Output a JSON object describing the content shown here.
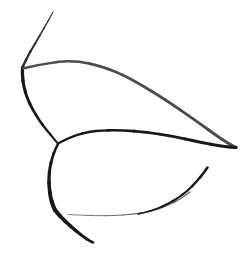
{
  "canvas": {
    "width": 252,
    "height": 255,
    "background_color": "#ffffff",
    "title": "Abstract ink line drawing",
    "medium": "pen-and-ink contour sketch",
    "has_text": false,
    "has_color": false
  },
  "palette": {
    "ink_dark": "#18181a",
    "ink_mid": "#2e2e32",
    "ink_light": "#4a4a50",
    "ink_faint": "#6b6b72",
    "paper": "#ffffff"
  },
  "strokes": [
    {
      "name": "top-antenna-stroke",
      "description": "thin curve descending from top edge to the upper-left cusp",
      "color_key": "ink_mid",
      "width_start": 1.0,
      "width_end": 2.6,
      "path": "M 53 12 C 45 27 36 42 29 54 C 26 60 24 64 22.5 67.5"
    },
    {
      "name": "upper-left-cusp-down-stroke",
      "description": "heavy stroke from the cusp running down-left then curving right into the lower body junction",
      "color_key": "ink_dark",
      "width_start": 3.4,
      "width_end": 2.0,
      "path": "M 22.5 67.5 C 22 76 23 86 27 97 C 32 110 41 124 50 134 C 54 139 56 141.5 58 143.5"
    },
    {
      "name": "upper-body-top-contour",
      "description": "long thin arc forming the top edge of the upper leaf shape, from the cusp over the apex and sweeping down-right to the far right point",
      "color_key": "ink_light",
      "width_start": 2.4,
      "width_end": 3.0,
      "path": "M 22.5 68.5 C 33 66 45 63.5 59 61.8 C 82 59.5 108 66 136 82 C 168 100 200 124 220 138 C 228 143.5 233 146 236 147.5"
    },
    {
      "name": "upper-body-bottom-contour",
      "description": "stroke forming the lower edge of the upper leaf shape, from the left junction rightwards to the sharp right tip",
      "color_key": "ink_dark",
      "width_start": 2.2,
      "width_end": 3.2,
      "path": "M 58 143.5 C 70 137 82 132.5 96 131 C 126 128.5 160 133 190 140 C 212 145 228 147 236 147.5"
    },
    {
      "name": "lower-body-left-contour",
      "description": "thick stroke from the central junction curving down the left side and kinking toward the bottom tail",
      "color_key": "ink_dark",
      "width_start": 2.4,
      "width_end": 4.2,
      "path": "M 58 144 C 52 155 49 168 49 180 C 49 192 51 202 55 210"
    },
    {
      "name": "bottom-tail-stroke",
      "description": "thick short tail angling down-right to a blunt end at the bottom",
      "color_key": "ink_dark",
      "width_start": 4.2,
      "width_end": 2.4,
      "path": "M 55 210 C 62 219 73 229 84 237 C 88 240 91 241.5 93 242.5"
    },
    {
      "name": "lower-body-bottom-contour",
      "description": "very faint horizontal line along the bottom of the lower shape, thickening as it sweeps up to the right",
      "color_key": "ink_faint",
      "width_start": 0.8,
      "width_end": 1.4,
      "path": "M 68 214.5 C 92 216 118 216.5 142 213 C 160 210 176 203 190 192"
    },
    {
      "name": "lower-body-right-arc",
      "description": "dark arc rising from the bottom sweep up to a thin tapered end at upper right of the lower shape",
      "color_key": "ink_dark",
      "width_start": 1.6,
      "width_end": 2.6,
      "path": "M 138 214 C 158 210 174 202 187 191 C 197 182 203 174 207.5 167.5"
    }
  ],
  "features": [
    {
      "name": "upper-left-cusp",
      "x": 22,
      "y": 68,
      "note": "sharp three-way junction, heaviest ink"
    },
    {
      "name": "upper-apex",
      "x": 62,
      "y": 62,
      "note": "top of the upper leaf contour"
    },
    {
      "name": "right-point",
      "x": 236,
      "y": 147,
      "note": "sharp convergence of the two upper contours"
    },
    {
      "name": "central-junction",
      "x": 58,
      "y": 143,
      "note": "where upper and lower shapes meet"
    },
    {
      "name": "bottom-tail-end",
      "x": 93,
      "y": 242,
      "note": "blunt end of the tail stroke"
    },
    {
      "name": "lower-arc-end",
      "x": 207,
      "y": 167,
      "note": "thin tapered end of lower right arc"
    }
  ]
}
